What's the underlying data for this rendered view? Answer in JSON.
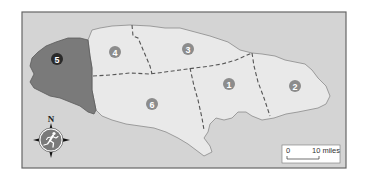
{
  "map": {
    "title": "",
    "colors": {
      "sea": "#d4d4d4",
      "land": "#e9e9e9",
      "highlight_region": "#7a7a7a",
      "border": "#555555",
      "coast": "#8a8a8a",
      "marker": "#8c8c8c",
      "marker_highlight": "#2a2a2a",
      "frame": "#666666"
    },
    "regions": [
      {
        "id": "1",
        "label": "1",
        "highlighted": false
      },
      {
        "id": "2",
        "label": "2",
        "highlighted": false
      },
      {
        "id": "3",
        "label": "3",
        "highlighted": false
      },
      {
        "id": "4",
        "label": "4",
        "highlighted": false
      },
      {
        "id": "5",
        "label": "5",
        "highlighted": true
      },
      {
        "id": "6",
        "label": "6",
        "highlighted": false
      }
    ],
    "compass": {
      "north_label": "N",
      "icon": "running-figure-icon"
    },
    "scale_bar": {
      "start_label": "0",
      "end_label": "10 miles"
    }
  }
}
